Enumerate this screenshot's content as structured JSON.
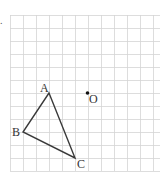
{
  "figure": {
    "question_marker": ".",
    "grid": {
      "origin_x": 10,
      "origin_y": 15,
      "cell": 13,
      "cols": 12,
      "rows": 12,
      "right_edge": 160,
      "line_color": "#d4d4d4"
    },
    "triangle": {
      "stroke_color": "#3a3a3a",
      "vertices": [
        {
          "label": "A",
          "col": 3,
          "row": 6,
          "label_dx": -9,
          "label_dy": -1
        },
        {
          "label": "B",
          "col": 1,
          "row": 9,
          "label_dx": -11,
          "label_dy": 4
        },
        {
          "label": "C",
          "col": 5,
          "row": 11,
          "label_dx": 2,
          "label_dy": 10
        }
      ]
    },
    "point": {
      "label": "O",
      "col": 6,
      "row": 6,
      "label_dx": 1,
      "label_dy": 10,
      "color": "#111111"
    },
    "label_color": "#333333"
  }
}
